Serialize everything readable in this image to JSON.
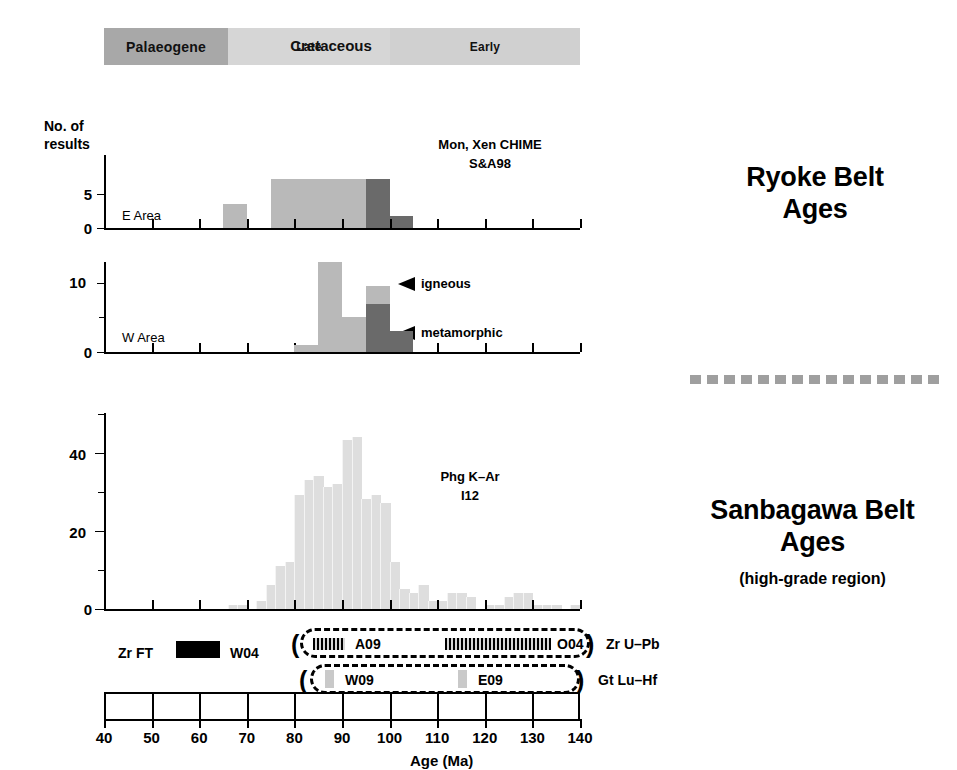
{
  "figure": {
    "timescale": {
      "epochs": [
        {
          "name": "Palaeogene",
          "start_ma": 40,
          "end_ma": 66,
          "style": "ep-pal",
          "size": "large"
        },
        {
          "name": "Late",
          "start_ma": 66,
          "end_ma": 100,
          "style": "ep-late",
          "size": "small"
        },
        {
          "name": "Early",
          "start_ma": 100,
          "end_ma": 140,
          "style": "ep-early",
          "size": "small"
        }
      ],
      "period_label": "Cretaceous"
    },
    "right_panel": {
      "ryoke_title_line1": "Ryoke Belt",
      "ryoke_title_line2": "Ages",
      "sanbagawa_title_line1": "Sanbagawa Belt",
      "sanbagawa_title_line2": "Ages",
      "sanbagawa_subtitle": "(high-grade region)"
    },
    "axis": {
      "x_title": "Age (Ma)",
      "x_ticks": [
        40,
        50,
        60,
        70,
        80,
        90,
        100,
        110,
        120,
        130,
        140
      ],
      "x_min": 40,
      "x_max": 140,
      "y_title_line1": "No. of",
      "y_title_line2": "results"
    },
    "key": {
      "zr_ft_label": "Zr FT",
      "zr_ft_source": "W04",
      "zr_upb_label": "Zr U–Pb",
      "zr_upb_items": [
        {
          "source": "A09",
          "start_ma": 93,
          "end_ma": 98
        },
        {
          "source": "O04",
          "start_ma": 112,
          "end_ma": 132
        }
      ],
      "gt_luhf_label": "Gt Lu–Hf",
      "gt_luhf_items": [
        {
          "source": "W09",
          "age_ma": 92
        },
        {
          "source": "E09",
          "age_ma": 116
        }
      ],
      "paren_open": "(",
      "paren_close": ")"
    },
    "colors": {
      "igneous": "#b9b9b9",
      "metamorphic": "#6a6a6a",
      "phengite": "#dedede",
      "black": "#000000",
      "timescale_palaeogene": "#a8a8a8",
      "timescale_late": "#d6d6d6",
      "timescale_early": "#d0d0d0",
      "divider_square": "#9f9f9f"
    }
  },
  "chart_data": [
    {
      "id": "e-area",
      "type": "bar",
      "title": "",
      "panel_label": "E Area",
      "annotation_lines": [
        "Mon, Xen CHIME",
        "S&A98"
      ],
      "xlabel": "Age (Ma)",
      "ylabel": "No. of results",
      "xlim": [
        40,
        140
      ],
      "ylim": [
        0,
        6
      ],
      "y_ticks": [
        0,
        5
      ],
      "bin_width_ma": 5,
      "grid": false,
      "series": [
        {
          "name": "igneous",
          "color": "#b9b9b9",
          "bins": [
            {
              "start_ma": 65,
              "end_ma": 70,
              "value": 2
            },
            {
              "start_ma": 75,
              "end_ma": 80,
              "value": 4
            },
            {
              "start_ma": 80,
              "end_ma": 85,
              "value": 4
            },
            {
              "start_ma": 85,
              "end_ma": 90,
              "value": 4
            },
            {
              "start_ma": 90,
              "end_ma": 95,
              "value": 4
            }
          ]
        },
        {
          "name": "metamorphic",
          "color": "#6a6a6a",
          "bins": [
            {
              "start_ma": 95,
              "end_ma": 100,
              "value": 4
            },
            {
              "start_ma": 100,
              "end_ma": 105,
              "value": 1
            }
          ]
        }
      ]
    },
    {
      "id": "w-area",
      "type": "bar",
      "title": "",
      "panel_label": "W Area",
      "annotations": [
        {
          "text": "igneous",
          "points_to_ma": 98,
          "points_to_value": 9
        },
        {
          "text": "metamorphic",
          "points_to_ma": 103,
          "points_to_value": 3
        }
      ],
      "xlabel": "Age (Ma)",
      "ylabel": "No. of results",
      "xlim": [
        40,
        140
      ],
      "ylim": [
        0,
        13
      ],
      "y_ticks": [
        0,
        5,
        10
      ],
      "bin_width_ma": 5,
      "grid": false,
      "series": [
        {
          "name": "igneous",
          "color": "#b9b9b9",
          "bins": [
            {
              "start_ma": 80,
              "end_ma": 85,
              "value": 1
            },
            {
              "start_ma": 85,
              "end_ma": 90,
              "value": 13
            },
            {
              "start_ma": 90,
              "end_ma": 95,
              "value": 5
            },
            {
              "start_ma": 95,
              "end_ma": 100,
              "value": 9.5
            }
          ]
        },
        {
          "name": "metamorphic",
          "color": "#6a6a6a",
          "bins": [
            {
              "start_ma": 95,
              "end_ma": 100,
              "value": 7
            },
            {
              "start_ma": 100,
              "end_ma": 105,
              "value": 3
            }
          ]
        }
      ]
    },
    {
      "id": "sanbagawa-phengite",
      "type": "bar",
      "title": "",
      "annotation_lines": [
        "Phg K–Ar",
        "I12"
      ],
      "xlabel": "Age (Ma)",
      "ylabel": "No. of results",
      "xlim": [
        40,
        140
      ],
      "ylim": [
        0,
        50
      ],
      "y_ticks": [
        0,
        20,
        40
      ],
      "y_minor_ticks": [
        10,
        30,
        50
      ],
      "bin_width_ma": 2,
      "grid": false,
      "color": "#dedede",
      "bins": [
        {
          "start_ma": 66,
          "end_ma": 68,
          "value": 1
        },
        {
          "start_ma": 68,
          "end_ma": 70,
          "value": 1
        },
        {
          "start_ma": 72,
          "end_ma": 74,
          "value": 2
        },
        {
          "start_ma": 74,
          "end_ma": 76,
          "value": 6
        },
        {
          "start_ma": 76,
          "end_ma": 78,
          "value": 11
        },
        {
          "start_ma": 78,
          "end_ma": 80,
          "value": 12
        },
        {
          "start_ma": 80,
          "end_ma": 82,
          "value": 29
        },
        {
          "start_ma": 82,
          "end_ma": 84,
          "value": 33
        },
        {
          "start_ma": 84,
          "end_ma": 86,
          "value": 34
        },
        {
          "start_ma": 86,
          "end_ma": 88,
          "value": 31
        },
        {
          "start_ma": 88,
          "end_ma": 90,
          "value": 32
        },
        {
          "start_ma": 90,
          "end_ma": 92,
          "value": 43
        },
        {
          "start_ma": 92,
          "end_ma": 94,
          "value": 44
        },
        {
          "start_ma": 94,
          "end_ma": 96,
          "value": 28
        },
        {
          "start_ma": 96,
          "end_ma": 98,
          "value": 29
        },
        {
          "start_ma": 98,
          "end_ma": 100,
          "value": 27
        },
        {
          "start_ma": 100,
          "end_ma": 102,
          "value": 12
        },
        {
          "start_ma": 102,
          "end_ma": 104,
          "value": 5
        },
        {
          "start_ma": 104,
          "end_ma": 106,
          "value": 4
        },
        {
          "start_ma": 106,
          "end_ma": 108,
          "value": 6
        },
        {
          "start_ma": 108,
          "end_ma": 110,
          "value": 2
        },
        {
          "start_ma": 110,
          "end_ma": 112,
          "value": 2
        },
        {
          "start_ma": 112,
          "end_ma": 114,
          "value": 4
        },
        {
          "start_ma": 114,
          "end_ma": 116,
          "value": 4
        },
        {
          "start_ma": 116,
          "end_ma": 118,
          "value": 3
        },
        {
          "start_ma": 120,
          "end_ma": 122,
          "value": 1
        },
        {
          "start_ma": 122,
          "end_ma": 124,
          "value": 1
        },
        {
          "start_ma": 124,
          "end_ma": 126,
          "value": 3
        },
        {
          "start_ma": 126,
          "end_ma": 128,
          "value": 4
        },
        {
          "start_ma": 128,
          "end_ma": 130,
          "value": 4
        },
        {
          "start_ma": 130,
          "end_ma": 132,
          "value": 1
        },
        {
          "start_ma": 132,
          "end_ma": 134,
          "value": 1
        },
        {
          "start_ma": 134,
          "end_ma": 136,
          "value": 1
        },
        {
          "start_ma": 138,
          "end_ma": 140,
          "value": 1
        }
      ]
    }
  ]
}
